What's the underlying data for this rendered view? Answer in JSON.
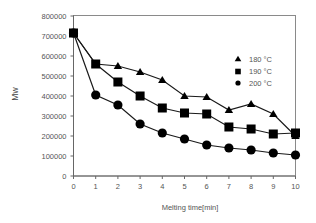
{
  "chart_data": {
    "type": "line",
    "title": "",
    "xlabel": "Melting time[min]",
    "ylabel": "Mw",
    "xlim": [
      0,
      10
    ],
    "ylim": [
      0,
      800000
    ],
    "x": [
      0,
      1,
      2,
      3,
      4,
      5,
      6,
      7,
      8,
      9,
      10
    ],
    "x_ticks": [
      "0",
      "1",
      "2",
      "3",
      "4",
      "5",
      "6",
      "7",
      "8",
      "9",
      "10"
    ],
    "y_ticks": [
      "0",
      "100000",
      "200000",
      "300000",
      "400000",
      "500000",
      "600000",
      "700000",
      "800000"
    ],
    "y_tick_values": [
      0,
      100000,
      200000,
      300000,
      400000,
      500000,
      600000,
      700000,
      800000
    ],
    "grid": false,
    "legend_position": "right",
    "series": [
      {
        "name": "180 °C",
        "marker": "triangle",
        "values": [
          715000,
          560000,
          550000,
          520000,
          480000,
          400000,
          395000,
          330000,
          360000,
          310000,
          200000
        ]
      },
      {
        "name": "190 °C",
        "marker": "square",
        "values": [
          715000,
          560000,
          470000,
          400000,
          340000,
          315000,
          310000,
          245000,
          235000,
          210000,
          215000
        ]
      },
      {
        "name": "200 °C",
        "marker": "circle",
        "values": [
          715000,
          405000,
          355000,
          260000,
          215000,
          185000,
          155000,
          140000,
          130000,
          115000,
          105000
        ]
      }
    ],
    "colors": {
      "line": "#1a1a1a",
      "axis": "#666666",
      "marker": "#000000"
    }
  }
}
